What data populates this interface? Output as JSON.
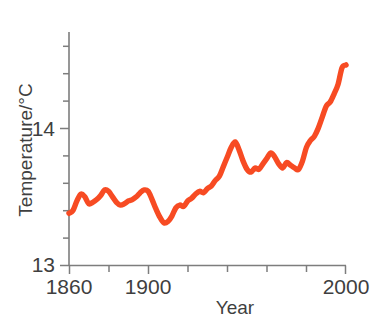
{
  "chart_data": {
    "type": "line",
    "title": "",
    "xlabel": "Year",
    "ylabel": "Temperature/°C",
    "xlim": [
      1860,
      2000
    ],
    "ylim": [
      13,
      14.7
    ],
    "grid": false,
    "legend": null,
    "line_color": "#F74B23",
    "axis_color": "#7D7D7D",
    "x_ticks_major": [
      1860,
      1900,
      2000
    ],
    "x_tick_labels": [
      "1860",
      "1900",
      "2000"
    ],
    "x_ticks_minor": [
      1880,
      1920,
      1940,
      1960,
      1980
    ],
    "y_ticks_major": [
      13,
      14
    ],
    "y_tick_labels": [
      "13",
      "14"
    ],
    "y_ticks_minor": [
      13.2,
      13.4,
      13.6,
      13.8,
      14.2,
      14.4,
      14.6
    ],
    "series": [
      {
        "name": "Global mean temperature",
        "x": [
          1860,
          1862,
          1864,
          1866,
          1868,
          1870,
          1872,
          1874,
          1876,
          1878,
          1880,
          1882,
          1884,
          1886,
          1888,
          1890,
          1892,
          1894,
          1896,
          1898,
          1900,
          1902,
          1904,
          1906,
          1908,
          1910,
          1912,
          1914,
          1916,
          1918,
          1920,
          1922,
          1924,
          1926,
          1928,
          1930,
          1932,
          1934,
          1936,
          1938,
          1940,
          1942,
          1944,
          1946,
          1948,
          1950,
          1952,
          1954,
          1956,
          1958,
          1960,
          1962,
          1964,
          1966,
          1968,
          1970,
          1972,
          1974,
          1976,
          1978,
          1980,
          1982,
          1984,
          1986,
          1988,
          1990,
          1992,
          1994,
          1996,
          1998,
          2000
        ],
        "y": [
          13.38,
          13.4,
          13.47,
          13.52,
          13.5,
          13.45,
          13.46,
          13.48,
          13.51,
          13.55,
          13.54,
          13.5,
          13.46,
          13.44,
          13.45,
          13.47,
          13.48,
          13.5,
          13.53,
          13.55,
          13.54,
          13.48,
          13.41,
          13.35,
          13.31,
          13.32,
          13.36,
          13.42,
          13.44,
          13.43,
          13.47,
          13.49,
          13.52,
          13.54,
          13.53,
          13.56,
          13.58,
          13.62,
          13.65,
          13.72,
          13.79,
          13.86,
          13.9,
          13.84,
          13.76,
          13.7,
          13.68,
          13.71,
          13.7,
          13.74,
          13.78,
          13.82,
          13.79,
          13.74,
          13.71,
          13.75,
          13.73,
          13.71,
          13.7,
          13.76,
          13.86,
          13.91,
          13.94,
          14.0,
          14.08,
          14.16,
          14.19,
          14.25,
          14.32,
          14.44,
          14.46
        ]
      }
    ]
  }
}
